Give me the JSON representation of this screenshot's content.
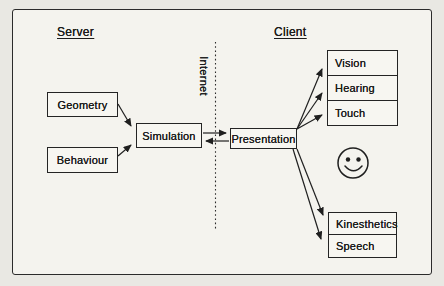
{
  "diagram": {
    "server_label": "Server",
    "client_label": "Client",
    "internet_label": "Internet",
    "nodes": {
      "geometry": "Geometry",
      "behaviour": "Behaviour",
      "simulation": "Simulation",
      "presentation": "Presentation",
      "vision": "Vision",
      "hearing": "Hearing",
      "touch": "Touch",
      "kinesthetics": "Kinesthetics",
      "speech": "Speech"
    },
    "edges": [
      {
        "from": "geometry",
        "to": "simulation",
        "style": "arrow"
      },
      {
        "from": "behaviour",
        "to": "simulation",
        "style": "arrow"
      },
      {
        "from": "simulation",
        "to": "presentation",
        "style": "arrow"
      },
      {
        "from": "presentation",
        "to": "simulation",
        "style": "arrow"
      },
      {
        "from": "presentation",
        "to": "vision",
        "style": "arrow"
      },
      {
        "from": "presentation",
        "to": "hearing",
        "style": "arrow"
      },
      {
        "from": "presentation",
        "to": "touch",
        "style": "arrow"
      },
      {
        "from": "presentation",
        "to": "kinesthetics",
        "style": "arrow"
      },
      {
        "from": "presentation",
        "to": "speech",
        "style": "arrow"
      }
    ],
    "divider": {
      "label": "Internet",
      "style": "vertical-dotted-line"
    },
    "icons": {
      "smiley": "smiley-face-icon"
    },
    "colors": {
      "ink": "#1f1f1f",
      "paper": "#e9e8e3",
      "frame_fill": "#f4f3ee",
      "box_fill": "#f7f6f1"
    }
  }
}
